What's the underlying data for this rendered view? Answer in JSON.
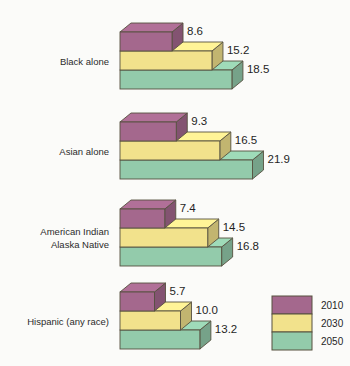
{
  "chart_data": {
    "type": "bar",
    "title": "",
    "subtitle": "",
    "xlabel": "",
    "ylabel": "",
    "orientation": "horizontal",
    "style": "3d-stepped-blocks",
    "grid": false,
    "legend_position": "bottom-right",
    "xlim": [
      0,
      21.9
    ],
    "categories": [
      "Black alone",
      "Asian alone",
      "American Indian\nAlaska Native",
      "Hispanic (any race)"
    ],
    "series": [
      {
        "name": "2010",
        "color": "#a4688d",
        "values": [
          8.6,
          9.3,
          7.4,
          5.7
        ]
      },
      {
        "name": "2030",
        "color": "#f2e28c",
        "values": [
          15.2,
          16.5,
          14.5,
          10.0
        ]
      },
      {
        "name": "2050",
        "color": "#93cbab",
        "values": [
          18.5,
          21.9,
          16.8,
          13.2
        ]
      }
    ],
    "value_labels": [
      [
        "8.6",
        "15.2",
        "18.5"
      ],
      [
        "9.3",
        "16.5",
        "21.9"
      ],
      [
        "7.4",
        "14.5",
        "16.8"
      ],
      [
        "5.7",
        "10.0",
        "13.2"
      ]
    ]
  },
  "groups": [
    {
      "label_lines": [
        "Black alone"
      ],
      "label": "Black alone",
      "bars": [
        {
          "series": "2010",
          "value": 8.6,
          "label": "8.6"
        },
        {
          "series": "2030",
          "value": 15.2,
          "label": "15.2"
        },
        {
          "series": "2050",
          "value": 18.5,
          "label": "18.5"
        }
      ]
    },
    {
      "label_lines": [
        "Asian alone"
      ],
      "label": "Asian alone",
      "bars": [
        {
          "series": "2010",
          "value": 9.3,
          "label": "9.3"
        },
        {
          "series": "2030",
          "value": 16.5,
          "label": "16.5"
        },
        {
          "series": "2050",
          "value": 21.9,
          "label": "21.9"
        }
      ]
    },
    {
      "label_lines": [
        "American Indian",
        "Alaska Native"
      ],
      "label": "American Indian Alaska Native",
      "bars": [
        {
          "series": "2010",
          "value": 7.4,
          "label": "7.4"
        },
        {
          "series": "2030",
          "value": 14.5,
          "label": "14.5"
        },
        {
          "series": "2050",
          "value": 16.8,
          "label": "16.8"
        }
      ]
    },
    {
      "label_lines": [
        "Hispanic (any race)"
      ],
      "label": "Hispanic (any race)",
      "bars": [
        {
          "series": "2010",
          "value": 5.7,
          "label": "5.7"
        },
        {
          "series": "2030",
          "value": 10.0,
          "label": "10.0"
        },
        {
          "series": "2050",
          "value": 13.2,
          "label": "13.2"
        }
      ]
    }
  ],
  "legend": {
    "items": [
      {
        "label": "2010",
        "color": "#a4688d"
      },
      {
        "label": "2030",
        "color": "#f2e28c"
      },
      {
        "label": "2050",
        "color": "#93cbab"
      }
    ]
  },
  "colors": {
    "background": "#fbfbf9",
    "series_2010": "#a4688d",
    "series_2030": "#f2e28c",
    "series_2050": "#93cbab",
    "outline": "#56503f",
    "text": "#1f1f1f"
  }
}
